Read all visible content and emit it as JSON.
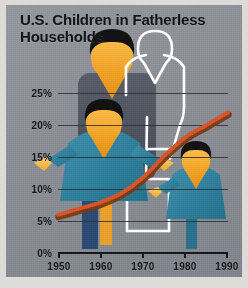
{
  "panel": {
    "background_color": "#8b8e95",
    "mat_color": "#dddbd8"
  },
  "title": {
    "text": "U.S. Children in Fatherless\nHouseholds",
    "color": "#111317"
  },
  "figures": {
    "adult_silhouette": {
      "name": "mother-large-figure",
      "hair_color": "#111111",
      "skin_color": "#f0a024",
      "body_color": "#4f545e"
    },
    "child_center": {
      "name": "child-center-figure",
      "hair_color": "#111111",
      "skin_color": "#f2b544",
      "body_color": "#2e7f9b",
      "leg_color": "#2b4a74"
    },
    "child_right": {
      "name": "child-right-figure",
      "hair_color": "#111111",
      "skin_color": "#f2b544",
      "body_color": "#2e7f9b"
    },
    "absent_father": {
      "name": "absent-father-outline",
      "outline_color": "#ffffff",
      "description": "white outline figure"
    }
  },
  "chart_data": {
    "type": "line",
    "title": "U.S. Children in Fatherless Households",
    "subtitle": "",
    "xlabel": "",
    "ylabel": "",
    "grid": true,
    "legend_position": "none",
    "line_color": "#d4552a",
    "line_shadow_color": "#7a3a14",
    "xlim": [
      1950,
      1990
    ],
    "ylim": [
      0,
      27
    ],
    "xticks": [
      1950,
      1960,
      1970,
      1980,
      1990
    ],
    "xticklabels": [
      "1950",
      "1960",
      "1970",
      "1980",
      "1990"
    ],
    "yticks": [
      0,
      5,
      10,
      15,
      20,
      25
    ],
    "yticklabels": [
      "0%",
      "5%",
      "10%",
      "15%",
      "20%",
      "25%"
    ],
    "x": [
      1950,
      1955,
      1960,
      1965,
      1970,
      1975,
      1980,
      1985,
      1990
    ],
    "values": [
      6.0,
      7.0,
      8.0,
      9.5,
      12.0,
      15.5,
      18.5,
      20.5,
      22.5
    ],
    "series": [
      {
        "name": "Children in fatherless households",
        "values": [
          6.0,
          7.0,
          8.0,
          9.5,
          12.0,
          15.5,
          18.5,
          20.5,
          22.5
        ]
      }
    ]
  }
}
